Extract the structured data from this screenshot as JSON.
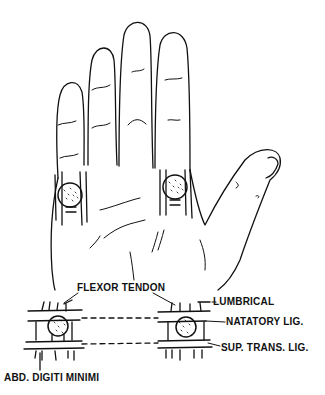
{
  "figure": {
    "type": "anatomical-line-drawing",
    "colors": {
      "ink": "#111111",
      "background": "#ffffff"
    }
  },
  "labels": {
    "flexor_tendon": "FLEXOR TENDON",
    "lumbrical": "LUMBRICAL",
    "natatory_lig": "NATATORY LIG.",
    "sup_trans_lig": "SUP. TRANS. LIG.",
    "abd_digiti_minimi": "ABD. DIGITI MINIMI"
  }
}
